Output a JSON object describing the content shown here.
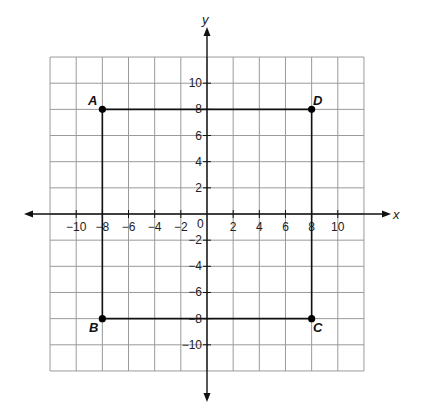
{
  "chart_data": {
    "type": "scatter",
    "title": "",
    "xlabel": "x",
    "ylabel": "y",
    "xlim": [
      -12,
      12
    ],
    "ylim": [
      -12,
      12
    ],
    "grid": true,
    "grid_step": 2,
    "x_ticks": [
      -10,
      -8,
      -6,
      -4,
      -2,
      2,
      4,
      6,
      8,
      10
    ],
    "y_ticks": [
      10,
      8,
      6,
      4,
      2,
      -2,
      -4,
      -6,
      -8,
      -10
    ],
    "origin_label": "0",
    "points": [
      {
        "label": "A",
        "x": -8,
        "y": 8
      },
      {
        "label": "B",
        "x": -8,
        "y": -8
      },
      {
        "label": "C",
        "x": 8,
        "y": -8
      },
      {
        "label": "D",
        "x": 8,
        "y": 8
      }
    ],
    "polygon": [
      "A",
      "D",
      "C",
      "B"
    ]
  },
  "axes": {
    "x_label": "x",
    "y_label": "y",
    "origin": "0"
  },
  "points": {
    "A": "A",
    "B": "B",
    "C": "C",
    "D": "D"
  }
}
